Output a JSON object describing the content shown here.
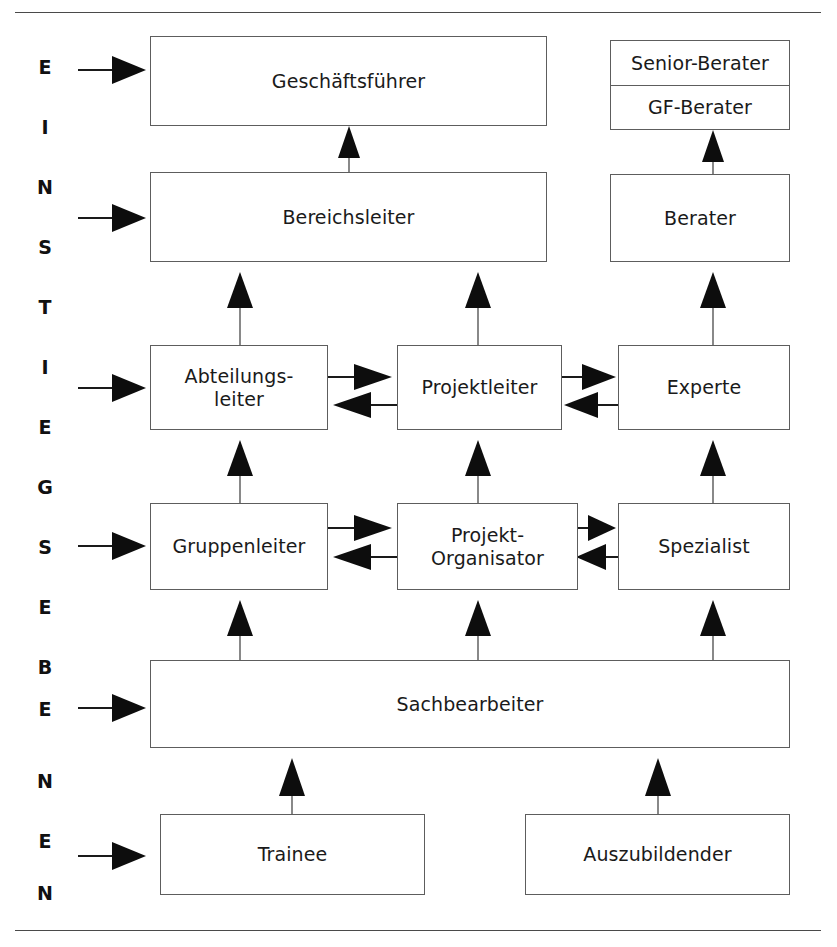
{
  "diagram": {
    "title_vertical": "EINSTIEGSEBENEN",
    "vertical_letters": [
      "E",
      "I",
      "N",
      "S",
      "T",
      "I",
      "E",
      "G",
      "S",
      "E",
      "B",
      "E",
      "N",
      "E",
      "N"
    ],
    "colors": {
      "box_border": "#5d5d5d",
      "box_fill": "#ffffff",
      "text": "#1a1a1a",
      "arrow": "#0d0d0d",
      "rule": "#4a4a4a"
    },
    "rows": [
      {
        "id": "row-executive",
        "nodes": [
          {
            "id": "geschaeftsfuehrer",
            "label": "Geschäftsführer"
          },
          {
            "id": "senior-berater",
            "label": "Senior-Berater"
          },
          {
            "id": "gf-berater",
            "label": "GF-Berater"
          }
        ]
      },
      {
        "id": "row-division",
        "nodes": [
          {
            "id": "bereichsleiter",
            "label": "Bereichsleiter"
          },
          {
            "id": "berater",
            "label": "Berater"
          }
        ]
      },
      {
        "id": "row-department",
        "nodes": [
          {
            "id": "abteilungsleiter",
            "label": "Abteilungs-\nleiter",
            "line1": "Abteilungs-",
            "line2": "leiter"
          },
          {
            "id": "projektleiter",
            "label": "Projektleiter"
          },
          {
            "id": "experte",
            "label": "Experte"
          }
        ]
      },
      {
        "id": "row-group",
        "nodes": [
          {
            "id": "gruppenleiter",
            "label": "Gruppenleiter"
          },
          {
            "id": "projekt-organisator",
            "label": "Projekt-\nOrganisator",
            "line1": "Projekt-",
            "line2": "Organisator"
          },
          {
            "id": "spezialist",
            "label": "Spezialist"
          }
        ]
      },
      {
        "id": "row-clerk",
        "nodes": [
          {
            "id": "sachbearbeiter",
            "label": "Sachbearbeiter"
          }
        ]
      },
      {
        "id": "row-entry",
        "nodes": [
          {
            "id": "trainee",
            "label": "Trainee"
          },
          {
            "id": "auszubildender",
            "label": "Auszubildender"
          }
        ]
      }
    ],
    "entry_points": [
      {
        "id": "entry-geschaeftsfuehrer",
        "target": "Geschäftsführer"
      },
      {
        "id": "entry-bereichsleiter",
        "target": "Bereichsleiter"
      },
      {
        "id": "entry-abteilungsleiter",
        "target": "Abteilungsleiter"
      },
      {
        "id": "entry-gruppenleiter",
        "target": "Gruppenleiter"
      },
      {
        "id": "entry-sachbearbeiter",
        "target": "Sachbearbeiter"
      },
      {
        "id": "entry-trainee",
        "target": "Trainee"
      }
    ],
    "promotion_paths": [
      {
        "from": "Bereichsleiter",
        "to": "Geschäftsführer"
      },
      {
        "from": "Berater",
        "to": "GF-Berater"
      },
      {
        "from": "Abteilungsleiter",
        "to": "Bereichsleiter"
      },
      {
        "from": "Projektleiter",
        "to": "Bereichsleiter"
      },
      {
        "from": "Experte",
        "to": "Berater"
      },
      {
        "from": "Gruppenleiter",
        "to": "Abteilungsleiter"
      },
      {
        "from": "Projekt-Organisator",
        "to": "Projektleiter"
      },
      {
        "from": "Spezialist",
        "to": "Experte"
      },
      {
        "from": "Sachbearbeiter",
        "to": "Gruppenleiter"
      },
      {
        "from": "Sachbearbeiter",
        "to": "Projekt-Organisator"
      },
      {
        "from": "Sachbearbeiter",
        "to": "Spezialist"
      },
      {
        "from": "Trainee",
        "to": "Sachbearbeiter"
      },
      {
        "from": "Auszubildender",
        "to": "Sachbearbeiter"
      }
    ],
    "lateral_paths": [
      {
        "from": "Abteilungsleiter",
        "to": "Projektleiter"
      },
      {
        "from": "Projektleiter",
        "to": "Abteilungsleiter"
      },
      {
        "from": "Projektleiter",
        "to": "Experte"
      },
      {
        "from": "Experte",
        "to": "Projektleiter"
      },
      {
        "from": "Gruppenleiter",
        "to": "Projekt-Organisator"
      },
      {
        "from": "Projekt-Organisator",
        "to": "Gruppenleiter"
      },
      {
        "from": "Projekt-Organisator",
        "to": "Spezialist"
      },
      {
        "from": "Spezialist",
        "to": "Projekt-Organisator"
      }
    ]
  }
}
